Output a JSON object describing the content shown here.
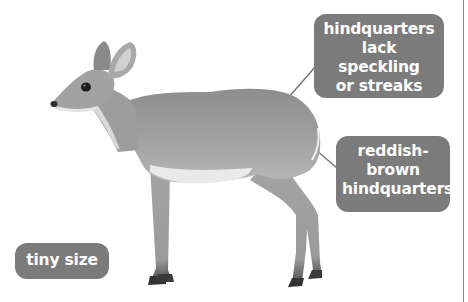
{
  "figure": {
    "colors": {
      "callout_bg": "#7b7b7b",
      "callout_text": "#ffffff",
      "leader_line": "#6e6e6e",
      "body_fill": "#9a9a9a",
      "belly_fill": "#e9e9e9",
      "hoof_fill": "#3a3a3a"
    }
  },
  "labels": {
    "hindquarters_pattern": {
      "lines": [
        "hindquarters",
        "lack speckling",
        "or streaks"
      ]
    },
    "hindquarters_color": {
      "lines": [
        "reddish-",
        "brown",
        "hindquarters"
      ]
    },
    "size": {
      "lines": [
        "tiny size"
      ]
    }
  }
}
